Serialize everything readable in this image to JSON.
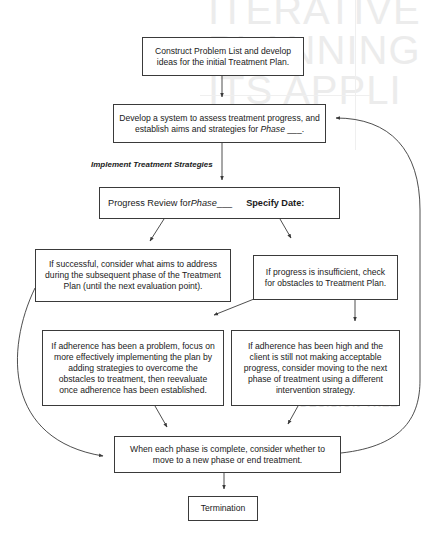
{
  "background_bleed": {
    "title_lines": [
      "ITERATIVE",
      "PLANNING",
      "ITS APPLI"
    ],
    "section_heading": "DECISION TREE"
  },
  "nodes": {
    "construct_plan": {
      "text": "Construct Problem List and develop ideas for the initial Treatment Plan."
    },
    "develop_system": {
      "text_prefix": "Develop a system to assess treatment progress, and establish aims and strategies for ",
      "text_italic": "Phase",
      "text_suffix": " ___."
    },
    "progress_review": {
      "text_prefix": "Progress Review for ",
      "text_italic": "Phase",
      "text_blank": " ___",
      "text_bold": "Specify Date:"
    },
    "if_successful": {
      "text": "If successful, consider what aims to address during the subsequent phase of the Treatment Plan (until the next evaluation point)."
    },
    "if_insufficient": {
      "text": "If progress is insufficient, check for obstacles to Treatment Plan."
    },
    "adherence_problem": {
      "text": "If adherence has been a problem, focus on more effectively implementing the plan by adding strategies to overcome the obstacles to treatment, then reevaluate once adherence has been established."
    },
    "adherence_high": {
      "text": "If adherence has been high and the client is still not making acceptable progress, consider moving to the next phase of treatment using a different intervention strategy."
    },
    "phase_complete": {
      "text": "When each phase is complete, consider whether to move to a new phase or end treatment."
    },
    "termination": {
      "text": "Termination"
    }
  },
  "edge_labels": {
    "implement": "Implement Treatment Strategies"
  },
  "edges": [
    {
      "from": "construct_plan",
      "to": "develop_system"
    },
    {
      "from": "develop_system",
      "to": "progress_review",
      "label": "Implement Treatment Strategies"
    },
    {
      "from": "progress_review",
      "to": "if_successful"
    },
    {
      "from": "progress_review",
      "to": "if_insufficient"
    },
    {
      "from": "if_insufficient",
      "to": "adherence_problem"
    },
    {
      "from": "if_insufficient",
      "to": "adherence_high"
    },
    {
      "from": "adherence_problem",
      "to": "phase_complete"
    },
    {
      "from": "adherence_high",
      "to": "phase_complete"
    },
    {
      "from": "if_successful",
      "to": "phase_complete"
    },
    {
      "from": "phase_complete",
      "to": "develop_system"
    },
    {
      "from": "phase_complete",
      "to": "termination"
    }
  ],
  "colors": {
    "line": "#3a3a3a",
    "text": "#1a1a1a",
    "background": "#ffffff"
  }
}
